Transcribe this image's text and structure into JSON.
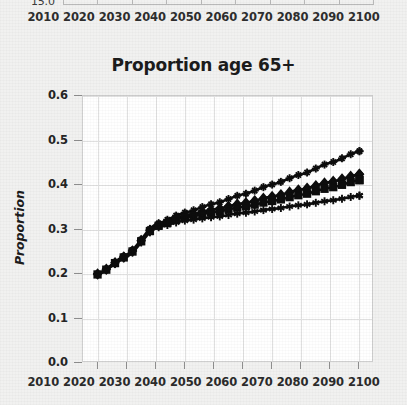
{
  "page": {
    "background_color": "#f1f1f0"
  },
  "top_remnant": {
    "name": "cut-off-chart-above",
    "cut_y_label": "15.0",
    "x_tick_labels": [
      "2010",
      "2020",
      "2030",
      "2040",
      "2050",
      "2060",
      "2070",
      "2080",
      "2090",
      "2100"
    ]
  },
  "chart_data": {
    "type": "line",
    "title": "Proportion age 65+",
    "xlabel": "",
    "ylabel": "Proportion",
    "x": [
      2010,
      2020,
      2030,
      2040,
      2050,
      2060,
      2070,
      2080,
      2090,
      2100
    ],
    "xlim": [
      2005,
      2105
    ],
    "ylim": [
      0.0,
      0.6
    ],
    "ytick_labels": [
      "0.0",
      "0.1",
      "0.2",
      "0.3",
      "0.4",
      "0.5",
      "0.6"
    ],
    "ytick_values": [
      0.0,
      0.1,
      0.2,
      0.3,
      0.4,
      0.5,
      0.6
    ],
    "xtick_labels": [
      "2010",
      "2020",
      "2030",
      "2040",
      "2050",
      "2060",
      "2070",
      "2080",
      "2090",
      "2100"
    ],
    "grid": true,
    "legend_position": "none",
    "line_color": "#0d0d0d",
    "series": [
      {
        "name": "series-plus",
        "marker": "plus-star",
        "values": [
          0.2,
          0.243,
          0.312,
          0.338,
          0.358,
          0.379,
          0.401,
          0.424,
          0.45,
          0.476
        ]
      },
      {
        "name": "series-diamond",
        "marker": "diamond",
        "values": [
          0.2,
          0.241,
          0.309,
          0.331,
          0.345,
          0.359,
          0.374,
          0.39,
          0.407,
          0.424
        ]
      },
      {
        "name": "series-square",
        "marker": "square",
        "values": [
          0.199,
          0.24,
          0.307,
          0.327,
          0.339,
          0.351,
          0.364,
          0.378,
          0.394,
          0.411
        ]
      },
      {
        "name": "series-asterisk",
        "marker": "asterisk",
        "values": [
          0.199,
          0.238,
          0.304,
          0.32,
          0.328,
          0.337,
          0.346,
          0.355,
          0.365,
          0.376
        ]
      }
    ],
    "annual_points_per_decade": 10
  }
}
